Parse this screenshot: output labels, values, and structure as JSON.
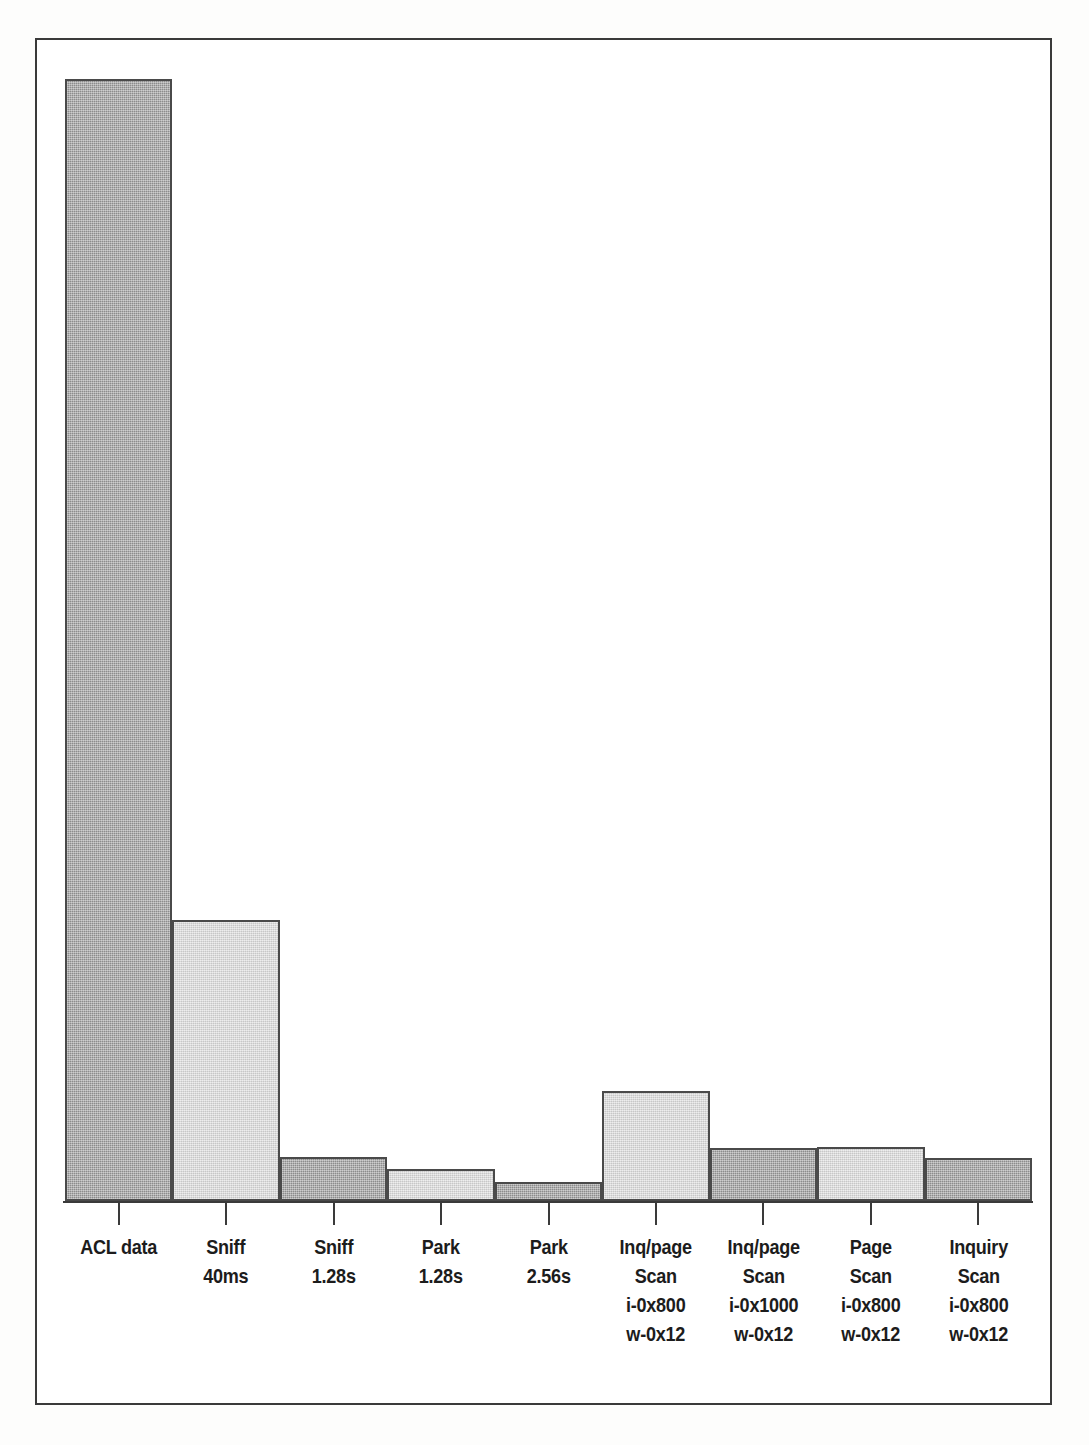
{
  "figure": {
    "background_color": "#ffffff",
    "frame_color": "#3a3a3a",
    "bar_dark_color": "#9c9c9c",
    "bar_light_color": "#dddddd",
    "bar_edge_color": "#4a4a4a"
  },
  "chart_data": {
    "type": "bar",
    "title": "",
    "subtitle": "",
    "xlabel": "",
    "ylabel": "",
    "grid": false,
    "legend": null,
    "axis": {
      "x_ticks_at_bar_centers": true,
      "y_axis_visible": false,
      "y_tick_labels": [],
      "ylim": [
        0,
        1160
      ]
    },
    "categories": [
      "ACL data",
      "Sniff\n40ms",
      "Sniff\n1.28s",
      "Park\n1.28s",
      "Park\n2.56s",
      "Inq/page\nScan\ni-0x800\nw-0x12",
      "Inq/page\nScan\ni-0x1000\nw-0x12",
      "Page\nScan\ni-0x800\nw-0x12",
      "Inquiry\nScan\ni-0x800\nw-0x12"
    ],
    "category_lines": [
      [
        "ACL data"
      ],
      [
        "Sniff",
        "40ms"
      ],
      [
        "Sniff",
        "1.28s"
      ],
      [
        "Park",
        "1.28s"
      ],
      [
        "Park",
        "2.56s"
      ],
      [
        "Inq/page",
        "Scan",
        "i-0x800",
        "w-0x12"
      ],
      [
        "Inq/page",
        "Scan",
        "i-0x1000",
        "w-0x12"
      ],
      [
        "Page",
        "Scan",
        "i-0x800",
        "w-0x12"
      ],
      [
        "Inquiry",
        "Scan",
        "i-0x800",
        "w-0x12"
      ]
    ],
    "values": [
      1122,
      281,
      44,
      32,
      19,
      110,
      53,
      54,
      43
    ],
    "bar_fill_sequence": [
      "dark",
      "light",
      "dark",
      "light",
      "dark",
      "light",
      "dark",
      "light",
      "dark"
    ]
  }
}
